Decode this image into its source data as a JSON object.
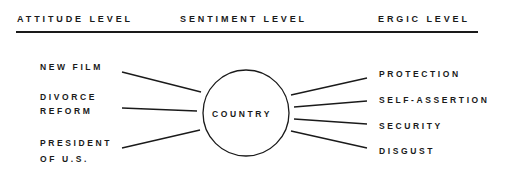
{
  "header": {
    "columns": [
      {
        "label": "ATTITUDE LEVEL"
      },
      {
        "label": "SENTIMENT LEVEL"
      },
      {
        "label": "ERGIC LEVEL"
      }
    ]
  },
  "diagram": {
    "center": {
      "label": "COUNTRY"
    },
    "attitudes": [
      {
        "line1": "NEW FILM",
        "line2": ""
      },
      {
        "line1": "DIVORCE",
        "line2": "REFORM"
      },
      {
        "line1": "PRESIDENT",
        "line2": "OF U.S."
      }
    ],
    "ergs": [
      {
        "label": "PROTECTION"
      },
      {
        "label": "SELF-ASSERTION"
      },
      {
        "label": "SECURITY"
      },
      {
        "label": "DISGUST"
      }
    ]
  }
}
